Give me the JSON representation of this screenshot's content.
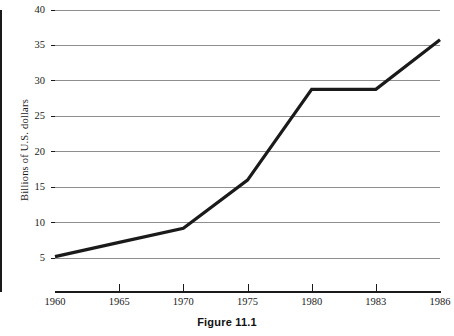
{
  "figure": {
    "caption": "Figure 11.1"
  },
  "chart_data": {
    "type": "line",
    "title": "",
    "subtitle": "",
    "xlabel": "",
    "ylabel": "Billions of U.S. dollars",
    "categories": [
      "1960",
      "1965",
      "1970",
      "1975",
      "1980",
      "1983",
      "1986"
    ],
    "values": [
      5.2,
      7.2,
      9.2,
      16.0,
      28.8,
      28.8,
      35.8
    ],
    "series": [
      {
        "name": "Billions of U.S. dollars",
        "values": [
          5.2,
          7.2,
          9.2,
          16.0,
          28.8,
          28.8,
          35.8
        ]
      }
    ],
    "x": [
      "1960",
      "1965",
      "1970",
      "1975",
      "1980",
      "1983",
      "1986"
    ],
    "ylim": [
      0,
      40
    ],
    "y_ticks": [
      "5",
      "10",
      "15",
      "20",
      "25",
      "30",
      "35",
      "40"
    ],
    "y_tick_values": [
      5,
      10,
      15,
      20,
      25,
      30,
      35,
      40
    ],
    "x_ticks": [
      "1960",
      "1965",
      "1970",
      "1975",
      "1980",
      "1983",
      "1986"
    ],
    "grid": "horizontal",
    "legend": "none",
    "line_color": "#1a1a1a",
    "grid_color": "#8e8e8e",
    "axis_color": "#1a1a1a",
    "background_color": "#ffffff"
  }
}
